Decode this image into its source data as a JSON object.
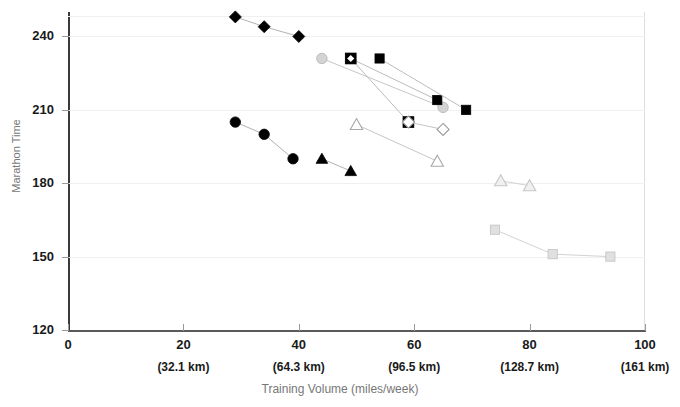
{
  "chart_data": {
    "type": "line",
    "title": "",
    "xlabel": "Training Volume (miles/week)",
    "ylabel": "Marathon Time",
    "xlim": [
      0,
      100
    ],
    "ylim": [
      120,
      250
    ],
    "grid": true,
    "legend": "none",
    "x_ticks": [
      {
        "value": 0,
        "label": "0",
        "km": ""
      },
      {
        "value": 20,
        "label": "20",
        "km": "(32.1 km)"
      },
      {
        "value": 40,
        "label": "40",
        "km": "(64.3 km)"
      },
      {
        "value": 60,
        "label": "60",
        "km": "(96.5 km)"
      },
      {
        "value": 80,
        "label": "80",
        "km": "(128.7 km)"
      },
      {
        "value": 100,
        "label": "100",
        "km": "(161 km)"
      }
    ],
    "y_ticks": [
      {
        "value": 120,
        "label": "120"
      },
      {
        "value": 150,
        "label": "150"
      },
      {
        "value": 180,
        "label": "180"
      },
      {
        "value": 210,
        "label": "210"
      },
      {
        "value": 240,
        "label": "240"
      }
    ],
    "series": [
      {
        "name": "filled-diamond",
        "marker": "diamond",
        "fill": "#000000",
        "stroke": "#000000",
        "line_color": "#a8a8a8",
        "points": [
          {
            "x": 29,
            "y": 248
          },
          {
            "x": 34,
            "y": 244
          },
          {
            "x": 40,
            "y": 240
          }
        ]
      },
      {
        "name": "filled-circle",
        "marker": "circle",
        "fill": "#000000",
        "stroke": "#000000",
        "line_color": "#a8a8a8",
        "points": [
          {
            "x": 29,
            "y": 205
          },
          {
            "x": 34,
            "y": 200
          },
          {
            "x": 39,
            "y": 190
          }
        ]
      },
      {
        "name": "filled-triangle",
        "marker": "triangle",
        "fill": "#000000",
        "stroke": "#000000",
        "line_color": "#a8a8a8",
        "points": [
          {
            "x": 44,
            "y": 190
          },
          {
            "x": 49,
            "y": 185
          }
        ]
      },
      {
        "name": "gray-circle",
        "marker": "circle",
        "fill": "#d4d4d4",
        "stroke": "#b0b0b0",
        "line_color": "#c0c0c0",
        "points": [
          {
            "x": 44,
            "y": 231
          },
          {
            "x": 65,
            "y": 211
          }
        ]
      },
      {
        "name": "filled-square-a",
        "marker": "square",
        "fill": "#000000",
        "stroke": "#000000",
        "line_color": "#b4b4b4",
        "points": [
          {
            "x": 49,
            "y": 231
          },
          {
            "x": 64,
            "y": 214
          }
        ]
      },
      {
        "name": "filled-square-b",
        "marker": "square",
        "fill": "#000000",
        "stroke": "#000000",
        "line_color": "#b4b4b4",
        "points": [
          {
            "x": 54,
            "y": 231
          },
          {
            "x": 69,
            "y": 210
          }
        ]
      },
      {
        "name": "square-diamond-open",
        "marker": "square-diamond",
        "fill": "#000000",
        "stroke": "#000000",
        "line_color": "#b4b4b4",
        "points": [
          {
            "x": 49,
            "y": 231
          },
          {
            "x": 59,
            "y": 205
          }
        ]
      },
      {
        "name": "open-diamond",
        "marker": "open-diamond",
        "fill": "#ffffff",
        "stroke": "#9a9a9a",
        "line_color": "#bdbdbd",
        "points": [
          {
            "x": 59,
            "y": 205
          },
          {
            "x": 65,
            "y": 202
          }
        ]
      },
      {
        "name": "open-triangle",
        "marker": "open-triangle",
        "fill": "#ffffff",
        "stroke": "#a8a8a8",
        "line_color": "#c0c0c0",
        "points": [
          {
            "x": 50,
            "y": 204
          },
          {
            "x": 64,
            "y": 189
          }
        ]
      },
      {
        "name": "gray-triangle",
        "marker": "open-triangle",
        "fill": "#f0f0f0",
        "stroke": "#c6c6c6",
        "line_color": "#cdcdcd",
        "points": [
          {
            "x": 75,
            "y": 181
          },
          {
            "x": 80,
            "y": 179
          }
        ]
      },
      {
        "name": "gray-square",
        "marker": "square",
        "fill": "#e0e0e0",
        "stroke": "#c2c2c2",
        "line_color": "#cdcdcd",
        "points": [
          {
            "x": 74,
            "y": 161
          },
          {
            "x": 84,
            "y": 151
          },
          {
            "x": 94,
            "y": 150
          }
        ]
      }
    ]
  }
}
